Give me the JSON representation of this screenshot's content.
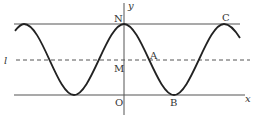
{
  "figure": {
    "colors": {
      "curve": "#222222",
      "lines": "#555555",
      "dashed": "#555555",
      "text": "#333333"
    },
    "axes": {
      "x_label": "x",
      "y_label": "y",
      "origin_label": "O"
    },
    "lines": {
      "top": {
        "label": "",
        "style": "solid"
      },
      "midline": {
        "label": "l",
        "style": "dashed"
      },
      "bottom": {
        "label": "",
        "style": "solid",
        "is_x_axis": true
      }
    },
    "points": [
      {
        "name": "N",
        "label": "N",
        "location": "curve maximum on y-axis"
      },
      {
        "name": "M",
        "label": "M",
        "location": "midline on y-axis"
      },
      {
        "name": "O",
        "label": "O",
        "location": "origin"
      },
      {
        "name": "A",
        "label": "A",
        "location": "curve crosses midline"
      },
      {
        "name": "B",
        "label": "B",
        "location": "curve minimum on x-axis"
      },
      {
        "name": "C",
        "label": "C",
        "location": "curve maximum on top line"
      }
    ]
  }
}
